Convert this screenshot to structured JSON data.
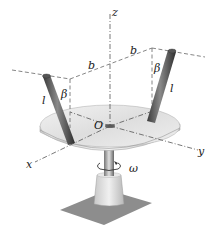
{
  "figure": {
    "type": "mechanics-diagram",
    "labels": {
      "z_axis": "z",
      "x_axis": "x",
      "y_axis": "y",
      "origin": "O",
      "dimension_left": "b",
      "dimension_right": "b",
      "rod_length_left": "l",
      "rod_length_right": "l",
      "angle_left": "β",
      "angle_right": "β",
      "angular_velocity": "ω"
    },
    "colors": {
      "disk_top": "#e6e6e6",
      "disk_edge": "#bdbdbd",
      "rod": "#5a5a5a",
      "base": "#dcdcdc",
      "shadow": "#8a8a8a",
      "dashed_lines": "#666666"
    }
  }
}
